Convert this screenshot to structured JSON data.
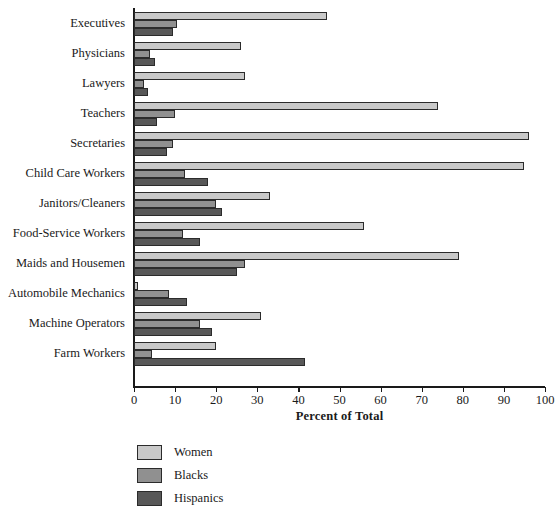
{
  "chart_data": {
    "type": "bar",
    "orientation": "horizontal",
    "title": "",
    "xlabel": "Percent of Total",
    "ylabel": "",
    "xlim": [
      0,
      100
    ],
    "xticks": [
      0,
      10,
      20,
      30,
      40,
      50,
      60,
      70,
      80,
      90,
      100
    ],
    "grid": false,
    "legend_position": "bottom-left",
    "categories": [
      "Executives",
      "Physicians",
      "Lawyers",
      "Teachers",
      "Secretaries",
      "Child Care Workers",
      "Janitors/Cleaners",
      "Food-Service Workers",
      "Maids and Housemen",
      "Automobile Mechanics",
      "Machine Operators",
      "Farm Workers"
    ],
    "series": [
      {
        "name": "Women",
        "color": "#c9c9c9",
        "values": [
          47,
          26,
          27,
          74,
          96,
          95,
          33,
          56,
          79,
          1,
          31,
          20
        ]
      },
      {
        "name": "Blacks",
        "color": "#909090",
        "values": [
          10.5,
          4,
          2.5,
          10,
          9.5,
          12.5,
          20,
          12,
          27,
          8.5,
          16,
          4.5
        ]
      },
      {
        "name": "Hispanics",
        "color": "#585858",
        "values": [
          9.5,
          5,
          3.5,
          5.5,
          8,
          18,
          21.5,
          16,
          25,
          13,
          19,
          41.5
        ]
      }
    ]
  }
}
